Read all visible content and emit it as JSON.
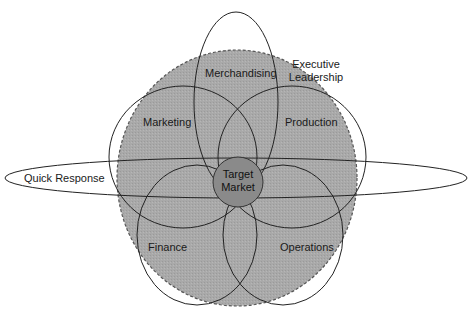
{
  "diagram": {
    "title": "",
    "background_region": {
      "label": "Executive Leadership",
      "fill": "#a8a8a8",
      "border": "dashed"
    },
    "core": {
      "label_line1": "Target",
      "label_line2": "Market",
      "fill": "#8c8c8c"
    },
    "petals": [
      {
        "id": "merchandising",
        "label": "Merchandising"
      },
      {
        "id": "marketing",
        "label": "Marketing"
      },
      {
        "id": "production",
        "label": "Production"
      },
      {
        "id": "finance",
        "label": "Finance"
      },
      {
        "id": "operations",
        "label": "Operations"
      }
    ],
    "crosscut": {
      "label": "Quick Response"
    },
    "executive_line1": "Executive",
    "executive_line2": "Leadership"
  }
}
